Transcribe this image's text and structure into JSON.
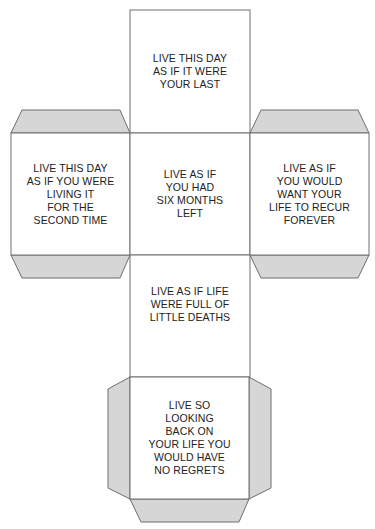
{
  "diagram": {
    "type": "cube-net",
    "colors": {
      "face_fill": "#ffffff",
      "flap_fill": "#d6d6d6",
      "stroke": "#6e6e6e",
      "text": "#222222"
    },
    "faces": {
      "top": {
        "text": "LIVE THIS DAY\nAS IF IT WERE\nYOUR LAST"
      },
      "left": {
        "text": "LIVE THIS DAY\nAS IF YOU WERE\nLIVING IT\nFOR THE\nSECOND TIME"
      },
      "center": {
        "text": "LIVE AS IF\nYOU HAD\nSIX MONTHS\nLEFT"
      },
      "right": {
        "text": "LIVE AS IF\nYOU WOULD\nWANT YOUR\nLIFE TO RECUR\nFOREVER"
      },
      "lower": {
        "text": "LIVE AS IF LIFE\nWERE FULL OF\nLITTLE DEATHS"
      },
      "bottom": {
        "text": "LIVE SO\nLOOKING\nBACK ON\nYOUR LIFE YOU\nWOULD HAVE\nNO REGRETS"
      }
    }
  }
}
